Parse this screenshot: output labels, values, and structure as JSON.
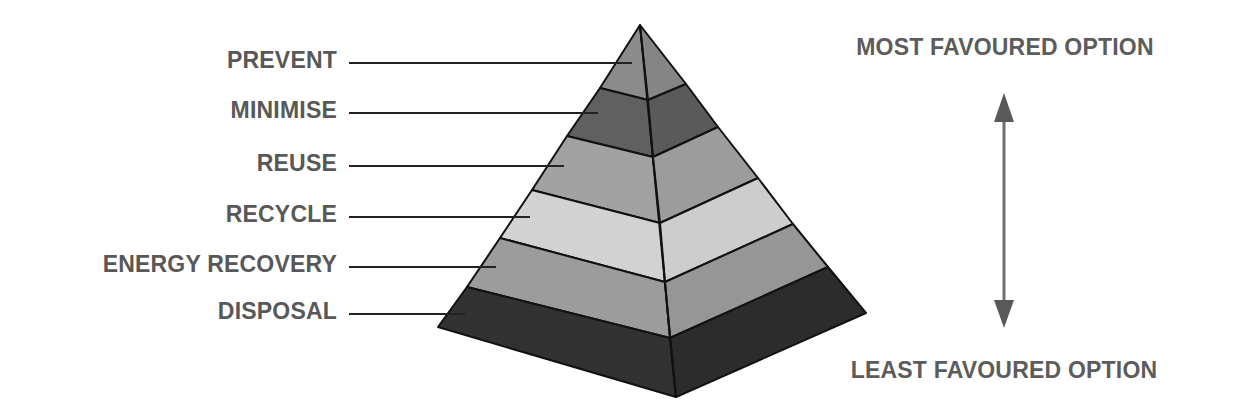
{
  "diagram": {
    "type": "pyramid",
    "levels": [
      {
        "label": "PREVENT",
        "color_left": "#8b8b8b",
        "color_right": "#858585"
      },
      {
        "label": "MINIMISE",
        "color_left": "#606060",
        "color_right": "#5a5a5a"
      },
      {
        "label": "REUSE",
        "color_left": "#a2a2a2",
        "color_right": "#9c9c9c"
      },
      {
        "label": "RECYCLE",
        "color_left": "#d2d2d2",
        "color_right": "#cdcdcd"
      },
      {
        "label": "ENERGY RECOVERY",
        "color_left": "#9c9c9c",
        "color_right": "#969696"
      },
      {
        "label": "DISPOSAL",
        "color_left": "#323232",
        "color_right": "#2c2c2c"
      }
    ],
    "scale": {
      "top_label": "MOST FAVOURED OPTION",
      "bottom_label": "LEAST FAVOURED OPTION",
      "arrow": "double-headed-vertical"
    },
    "colors": {
      "label_text": "#585858",
      "outline": "#111111",
      "leader_line": "#222222",
      "arrow": "#5e5e5e"
    }
  }
}
